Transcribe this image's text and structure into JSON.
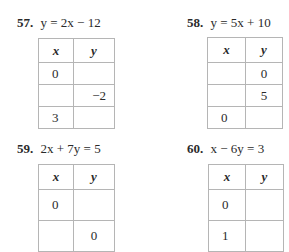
{
  "problems": [
    {
      "number": "57.",
      "equation": "y = 2x − 12",
      "headers": {
        "x": "x",
        "y": "y"
      },
      "rows": [
        {
          "x": "0",
          "y": ""
        },
        {
          "x": "",
          "y": "−2"
        },
        {
          "x": "3",
          "y": ""
        }
      ]
    },
    {
      "number": "58.",
      "equation": "y = 5x + 10",
      "headers": {
        "x": "x",
        "y": "y"
      },
      "rows": [
        {
          "x": "",
          "y": "0"
        },
        {
          "x": "",
          "y": "5"
        },
        {
          "x": "0",
          "y": ""
        }
      ]
    },
    {
      "number": "59.",
      "equation": "2x + 7y = 5",
      "headers": {
        "x": "x",
        "y": "y"
      },
      "rows": [
        {
          "x": "0",
          "y": ""
        },
        {
          "x": "",
          "y": "0"
        }
      ]
    },
    {
      "number": "60.",
      "equation": "x − 6y = 3",
      "headers": {
        "x": "x",
        "y": "y"
      },
      "rows": [
        {
          "x": "0",
          "y": ""
        },
        {
          "x": "1",
          "y": ""
        }
      ]
    }
  ]
}
